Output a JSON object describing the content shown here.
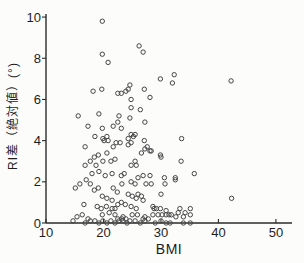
{
  "figure": {
    "xlabel": "BMI",
    "ylabel": "RI差（絶対値）(°)"
  },
  "chart_data": {
    "type": "scatter",
    "title": "",
    "xlabel": "BMI",
    "ylabel": "RI差（絶対値）(°)",
    "xlim": [
      10,
      52.8
    ],
    "ylim": [
      0,
      10.15
    ],
    "x_ticks": [
      10,
      20,
      30,
      40,
      50
    ],
    "y_ticks": [
      0,
      2,
      4,
      6,
      8,
      10
    ],
    "grid": false,
    "legend": null,
    "marker": "open-circle",
    "colors": {
      "axis": "#2b2b2b",
      "tick_label": "#1e1e1e",
      "marker_stroke": "#454545",
      "background": "#fcfcfb"
    },
    "points": [
      [
        19.8,
        9.8
      ],
      [
        19.8,
        8.2
      ],
      [
        20.8,
        7.8
      ],
      [
        24.6,
        6.7
      ],
      [
        26.2,
        8.6
      ],
      [
        26.9,
        8.3
      ],
      [
        29.9,
        7.0
      ],
      [
        32.3,
        7.2
      ],
      [
        32.0,
        6.8
      ],
      [
        42.2,
        6.9
      ],
      [
        18.2,
        6.4
      ],
      [
        19.7,
        6.5
      ],
      [
        22.5,
        6.3
      ],
      [
        23.9,
        6.4
      ],
      [
        23.1,
        6.3
      ],
      [
        24.3,
        6.5
      ],
      [
        27.1,
        6.5
      ],
      [
        24.8,
        6.0
      ],
      [
        28.1,
        6.1
      ],
      [
        24.8,
        5.6
      ],
      [
        26.4,
        5.5
      ],
      [
        15.6,
        5.2
      ],
      [
        19.2,
        5.3
      ],
      [
        22.7,
        5.2
      ],
      [
        22.5,
        4.9
      ],
      [
        24.6,
        5.1
      ],
      [
        17.3,
        4.7
      ],
      [
        19.8,
        4.6
      ],
      [
        21.7,
        4.7
      ],
      [
        27.2,
        4.9
      ],
      [
        23.1,
        4.6
      ],
      [
        18.5,
        4.2
      ],
      [
        19.9,
        4.1
      ],
      [
        20.6,
        4.2
      ],
      [
        20.1,
        4.0
      ],
      [
        20.8,
        4.0
      ],
      [
        24.8,
        4.3
      ],
      [
        25.5,
        4.3
      ],
      [
        25.2,
        4.2
      ],
      [
        24.3,
        4.1
      ],
      [
        33.6,
        4.1
      ],
      [
        16.8,
        3.7
      ],
      [
        21.7,
        3.7
      ],
      [
        22.2,
        3.9
      ],
      [
        22.9,
        3.9
      ],
      [
        24.3,
        3.8
      ],
      [
        24.8,
        3.9
      ],
      [
        27.1,
        4.0
      ],
      [
        27.6,
        3.7
      ],
      [
        27.2,
        3.6
      ],
      [
        28.3,
        3.5
      ],
      [
        29.9,
        3.3
      ],
      [
        18.4,
        3.2
      ],
      [
        19.1,
        3.3
      ],
      [
        20.6,
        3.4
      ],
      [
        26.6,
        3.4
      ],
      [
        28.1,
        3.5
      ],
      [
        30.0,
        3.2
      ],
      [
        16.8,
        2.8
      ],
      [
        17.7,
        3.0
      ],
      [
        18.7,
        2.8
      ],
      [
        19.9,
        3.0
      ],
      [
        21.3,
        3.0
      ],
      [
        22.0,
        3.1
      ],
      [
        24.8,
        2.8
      ],
      [
        25.7,
        2.8
      ],
      [
        25.5,
        3.0
      ],
      [
        33.5,
        3.0
      ],
      [
        18.0,
        2.4
      ],
      [
        19.2,
        2.5
      ],
      [
        20.3,
        2.3
      ],
      [
        21.5,
        2.4
      ],
      [
        23.1,
        2.3
      ],
      [
        23.6,
        2.4
      ],
      [
        26.0,
        2.2
      ],
      [
        26.9,
        2.3
      ],
      [
        28.1,
        2.3
      ],
      [
        30.6,
        2.2
      ],
      [
        32.5,
        2.2
      ],
      [
        35.8,
        2.4
      ],
      [
        15.9,
        1.9
      ],
      [
        17.0,
        2.1
      ],
      [
        17.7,
        1.9
      ],
      [
        23.2,
        1.9
      ],
      [
        30.7,
        1.9
      ],
      [
        32.5,
        2.1
      ],
      [
        24.8,
        2.0
      ],
      [
        25.5,
        1.9
      ],
      [
        27.4,
        1.9
      ],
      [
        28.3,
        1.9
      ],
      [
        15.1,
        1.7
      ],
      [
        18.4,
        1.6
      ],
      [
        19.1,
        1.7
      ],
      [
        21.7,
        1.7
      ],
      [
        22.4,
        1.5
      ],
      [
        19.8,
        1.3
      ],
      [
        20.6,
        1.2
      ],
      [
        21.5,
        1.1
      ],
      [
        30.0,
        1.4
      ],
      [
        24.3,
        1.4
      ],
      [
        25.0,
        1.3
      ],
      [
        25.7,
        1.2
      ],
      [
        26.6,
        1.3
      ],
      [
        26.0,
        1.4
      ],
      [
        26.9,
        1.1
      ],
      [
        23.1,
        1.0
      ],
      [
        42.3,
        1.2
      ],
      [
        16.6,
        0.9
      ],
      [
        18.9,
        0.8
      ],
      [
        19.6,
        0.7
      ],
      [
        20.5,
        0.8
      ],
      [
        21.5,
        0.7
      ],
      [
        22.0,
        0.7
      ],
      [
        22.5,
        0.9
      ],
      [
        23.8,
        0.9
      ],
      [
        24.8,
        0.8
      ],
      [
        25.7,
        0.7
      ],
      [
        28.6,
        0.8
      ],
      [
        29.2,
        0.7
      ],
      [
        29.9,
        0.7
      ],
      [
        30.9,
        0.6
      ],
      [
        33.3,
        0.7
      ],
      [
        35.1,
        0.7
      ],
      [
        28.8,
        0.7
      ],
      [
        30.9,
        0.4
      ],
      [
        31.8,
        0.4
      ],
      [
        33.0,
        0.5
      ],
      [
        34.2,
        0.5
      ],
      [
        21.0,
        0.5
      ],
      [
        25.9,
        0.4
      ],
      [
        29.5,
        0.4
      ],
      [
        30.2,
        0.4
      ],
      [
        15.4,
        0.3
      ],
      [
        16.3,
        0.4
      ],
      [
        17.3,
        0.2
      ],
      [
        19.8,
        0.4
      ],
      [
        22.0,
        0.4
      ],
      [
        23.4,
        0.3
      ],
      [
        25.0,
        0.4
      ],
      [
        27.2,
        0.3
      ],
      [
        28.6,
        0.4
      ],
      [
        31.4,
        0.4
      ],
      [
        32.6,
        0.3
      ],
      [
        33.9,
        0.3
      ],
      [
        35.1,
        0.4
      ],
      [
        22.5,
        0.2
      ],
      [
        23.2,
        0.2
      ],
      [
        23.9,
        0.2
      ],
      [
        24.6,
        0.1
      ],
      [
        26.9,
        0.2
      ],
      [
        27.8,
        0.2
      ],
      [
        14.7,
        0.1
      ],
      [
        16.8,
        0.0
      ],
      [
        17.7,
        0.1
      ],
      [
        18.5,
        0.1
      ],
      [
        19.2,
        0.0
      ],
      [
        19.9,
        0.1
      ],
      [
        20.6,
        0.0
      ],
      [
        21.3,
        0.1
      ],
      [
        22.0,
        0.0
      ],
      [
        22.7,
        0.1
      ],
      [
        23.4,
        0.1
      ],
      [
        24.1,
        0.0
      ],
      [
        25.5,
        0.1
      ],
      [
        26.4,
        0.0
      ],
      [
        27.2,
        0.1
      ],
      [
        29.0,
        0.0
      ],
      [
        30.0,
        0.1
      ],
      [
        30.9,
        0.0
      ],
      [
        31.6,
        0.0
      ],
      [
        33.9,
        0.0
      ],
      [
        35.1,
        0.0
      ]
    ]
  }
}
